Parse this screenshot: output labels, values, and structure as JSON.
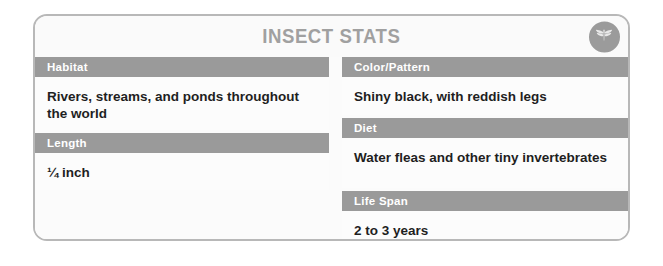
{
  "card": {
    "title": "INSECT STATS",
    "badge_icon": "dragonfly-icon",
    "accent_color": "#9a9a9a",
    "border_color": "#b8b8b8",
    "background_color": "#fbfbfb",
    "label_text_color": "#ffffff",
    "value_text_color": "#1f1f1f",
    "title_color": "#a0a0a0"
  },
  "columns": {
    "left": [
      {
        "label": "Habitat",
        "value": "Rivers, streams, and ponds throughout the world"
      },
      {
        "label": "Length",
        "value": "¼ inch"
      }
    ],
    "right": [
      {
        "label": "Color/Pattern",
        "value": "Shiny black, with reddish legs"
      },
      {
        "label": "Diet",
        "value": "Water fleas and other tiny invertebrates"
      },
      {
        "label": "Life Span",
        "value": "2 to 3 years"
      }
    ]
  }
}
